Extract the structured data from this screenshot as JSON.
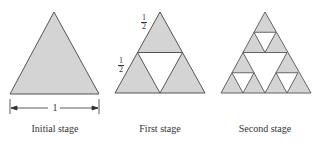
{
  "colors": {
    "fill": "#d4d4d4",
    "stroke": "#555555",
    "hole": "#ffffff"
  },
  "stages": [
    {
      "label": "Initial stage",
      "dimension_label": "1"
    },
    {
      "label": "First stage",
      "side_labels": [
        {
          "num": "1",
          "den": "2"
        },
        {
          "num": "1",
          "den": "2"
        }
      ]
    },
    {
      "label": "Second stage"
    }
  ]
}
